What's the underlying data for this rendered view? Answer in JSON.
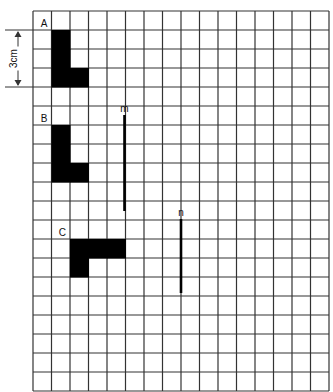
{
  "grid": {
    "cols": 16,
    "rows": 20,
    "x0": 33,
    "y0": 11,
    "cw": 18.5,
    "ch": 19,
    "line_color": "#333333"
  },
  "dimension": {
    "label": "3cm",
    "row_start": 1,
    "row_end": 4
  },
  "shapes": [
    {
      "label": "A",
      "cells": [
        [
          1,
          1
        ],
        [
          1,
          2
        ],
        [
          1,
          3
        ],
        [
          2,
          3
        ]
      ],
      "label_cell": [
        0,
        0
      ]
    },
    {
      "label": "B",
      "cells": [
        [
          1,
          6
        ],
        [
          1,
          7
        ],
        [
          1,
          8
        ],
        [
          2,
          8
        ]
      ],
      "label_cell": [
        0,
        5
      ]
    },
    {
      "label": "C",
      "cells": [
        [
          2,
          12
        ],
        [
          3,
          12
        ],
        [
          4,
          12
        ],
        [
          2,
          13
        ]
      ],
      "label_cell": [
        1,
        11
      ]
    }
  ],
  "lines": [
    {
      "label": "m",
      "x": 124.5,
      "y1": 115,
      "y2": 211
    },
    {
      "label": "n",
      "x": 181,
      "y1": 219,
      "y2": 293
    }
  ],
  "colors": {
    "fill": "#000000",
    "text": "#111111"
  }
}
